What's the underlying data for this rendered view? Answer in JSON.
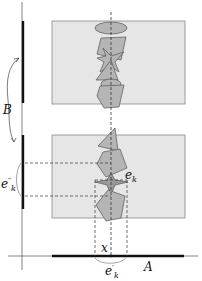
{
  "diagram": {
    "labels": {
      "B": "B",
      "A": "A",
      "x": "x",
      "ek": {
        "base": "e",
        "sub": "k"
      },
      "ek_prime": {
        "base": "e",
        "sup": "′",
        "sub": "k"
      },
      "ek_double_prime": {
        "base": "e",
        "sup": "″",
        "sub": "k"
      }
    },
    "colors": {
      "panel_fill": "#e6e6e6",
      "panel_stroke": "#888888",
      "shape_fill": "#b5b5b5",
      "shape_dark_fill": "#9a9a9a",
      "shape_stroke": "#555555",
      "axis": "#555555",
      "segment": "#111111",
      "dashed": "#333333"
    }
  }
}
